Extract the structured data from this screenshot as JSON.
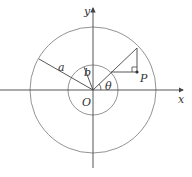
{
  "diagram": {
    "type": "geometry",
    "colors": {
      "stroke": "#555555",
      "text": "#333333",
      "background": "#ffffff"
    },
    "labels": {
      "x_axis": "x",
      "y_axis": "y",
      "origin": "O",
      "outer_radius": "a",
      "inner_radius": "b",
      "angle": "θ",
      "point": "P"
    },
    "geometry": {
      "origin": [
        93,
        90
      ],
      "outer_radius_px": 63,
      "inner_radius_px": 25,
      "ray_angle_deg": 45
    }
  }
}
